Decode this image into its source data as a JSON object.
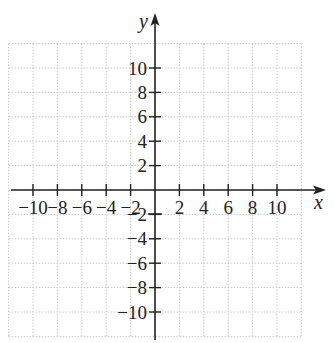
{
  "chart_data": {
    "type": "table",
    "title": "",
    "xlabel": "x",
    "ylabel": "y",
    "xlim": [
      -12,
      14
    ],
    "ylim": [
      -12,
      12
    ],
    "grid": true,
    "grid_step": 2,
    "x_ticks": [
      -10,
      -8,
      -6,
      -4,
      -2,
      2,
      4,
      6,
      8,
      10
    ],
    "y_ticks": [
      10,
      8,
      6,
      4,
      2,
      -2,
      -4,
      -6,
      -8,
      -10
    ],
    "x_tick_labels": [
      "−10",
      "−8",
      "−6",
      "−4",
      "−2",
      "2",
      "4",
      "6",
      "8",
      "10"
    ],
    "y_tick_labels": [
      "10",
      "8",
      "6",
      "4",
      "2",
      "−2",
      "−4",
      "−6",
      "−8",
      "−10"
    ],
    "series": []
  },
  "axes": {
    "x_name": "x",
    "y_name": "y"
  },
  "colors": {
    "axis": "#222222",
    "grid": "#c8c8c8",
    "background": "#ffffff"
  }
}
